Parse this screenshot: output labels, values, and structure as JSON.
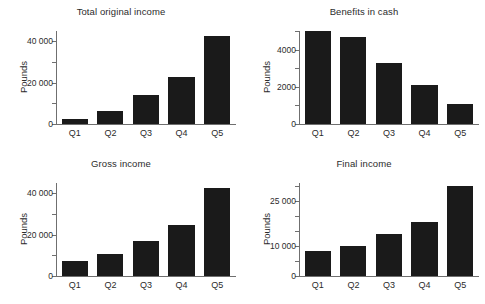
{
  "figure": {
    "background": "#ffffff",
    "bar_color": "#1a1a1a",
    "axis_color": "#6f6f6f",
    "text_color": "#2b2b2b"
  },
  "chart_data": [
    {
      "type": "bar",
      "title": "Total original income",
      "xlabel": "",
      "ylabel": "Pounds",
      "categories": [
        "Q1",
        "Q2",
        "Q3",
        "Q4",
        "Q5"
      ],
      "values": [
        2500,
        6500,
        14000,
        23000,
        42500
      ],
      "ylim": [
        0,
        45000
      ],
      "yticks": [
        0,
        10000,
        20000,
        30000,
        40000
      ],
      "ytick_labels": [
        "0",
        "",
        "20 000",
        "",
        "40 000"
      ],
      "grid": false,
      "legend": "none"
    },
    {
      "type": "bar",
      "title": "Benefits in cash",
      "xlabel": "",
      "ylabel": "Pounds",
      "categories": [
        "Q1",
        "Q2",
        "Q3",
        "Q4",
        "Q5"
      ],
      "values": [
        5000,
        4700,
        3300,
        2100,
        1100
      ],
      "ylim": [
        0,
        5000
      ],
      "yticks": [
        0,
        1000,
        2000,
        3000,
        4000,
        5000
      ],
      "ytick_labels": [
        "0",
        "",
        "2000",
        "",
        "4000",
        ""
      ],
      "grid": false,
      "legend": "none"
    },
    {
      "type": "bar",
      "title": "Gross income",
      "xlabel": "",
      "ylabel": "Pounds",
      "categories": [
        "Q1",
        "Q2",
        "Q3",
        "Q4",
        "Q5"
      ],
      "values": [
        7500,
        10500,
        17000,
        24500,
        42500
      ],
      "ylim": [
        0,
        45000
      ],
      "yticks": [
        0,
        10000,
        20000,
        30000,
        40000
      ],
      "ytick_labels": [
        "0",
        "",
        "20 000",
        "",
        "40 000"
      ],
      "grid": false,
      "legend": "none"
    },
    {
      "type": "bar",
      "title": "Final income",
      "xlabel": "",
      "ylabel": "Pounds",
      "categories": [
        "Q1",
        "Q2",
        "Q3",
        "Q4",
        "Q5"
      ],
      "values": [
        8500,
        10000,
        14000,
        18000,
        30000
      ],
      "ylim": [
        0,
        31000
      ],
      "yticks": [
        0,
        5000,
        10000,
        15000,
        20000,
        25000,
        30000
      ],
      "ytick_labels": [
        "0",
        "",
        "10 000",
        "",
        "",
        "25 000",
        ""
      ],
      "grid": false,
      "legend": "none"
    }
  ]
}
